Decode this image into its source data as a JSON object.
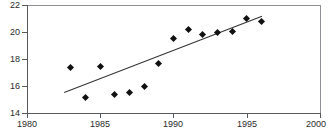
{
  "chart_data": {
    "type": "scatter",
    "title": "Figure 1. Average pumpkin yield per acre 1983 - 1996",
    "xlabel": "",
    "ylabel": "",
    "xlim": [
      1980,
      2000
    ],
    "ylim": [
      14,
      22
    ],
    "xticks": [
      1980,
      1985,
      1990,
      1995,
      2000
    ],
    "yticks": [
      14,
      16,
      18,
      20,
      22
    ],
    "grid": false,
    "legend": null,
    "x": [
      1983,
      1984,
      1985,
      1986,
      1987,
      1988,
      1989,
      1990,
      1991,
      1992,
      1993,
      1994,
      1995,
      1996
    ],
    "values": [
      17.4,
      15.15,
      17.45,
      15.4,
      15.55,
      16.0,
      17.7,
      19.55,
      20.2,
      19.85,
      19.95,
      20.05,
      21.0,
      20.8
    ],
    "series": [
      {
        "name": "observations",
        "marker": "diamond",
        "color": "#111111",
        "values": [
          17.4,
          15.15,
          17.45,
          15.4,
          15.55,
          16.0,
          17.7,
          19.55,
          20.2,
          19.85,
          19.95,
          20.05,
          21.0,
          20.8
        ]
      },
      {
        "name": "trend-line",
        "type": "line",
        "color": "#333333",
        "x": [
          1982.5,
          1996.0
        ],
        "values": [
          15.55,
          21.2
        ]
      }
    ]
  },
  "axes": {
    "y_tick_labels": [
      "22",
      "20",
      "18",
      "16",
      "14"
    ],
    "x_tick_labels": [
      "1980",
      "1985",
      "1990",
      "1995",
      "2000"
    ]
  }
}
